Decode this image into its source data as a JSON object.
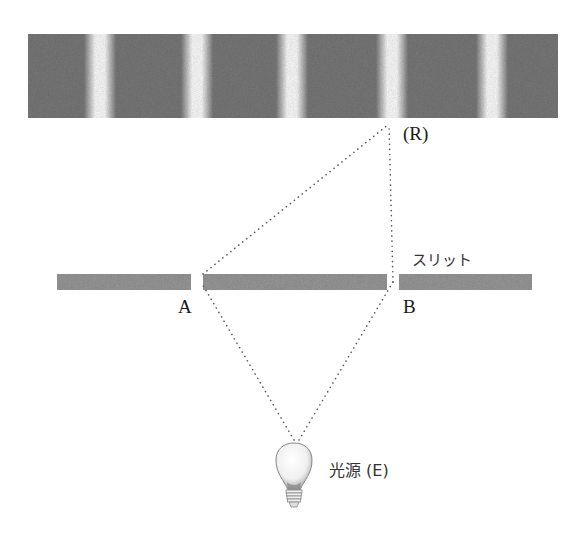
{
  "diagram": {
    "labels": {
      "screen_point": "(R)",
      "slit": "スリット",
      "slit_a": "A",
      "slit_b": "B",
      "light_source": "光源 (E)"
    },
    "fringe_screen": {
      "x": 28,
      "y": 34,
      "width": 530,
      "height": 84,
      "dark_color": "#7a7a7a",
      "bright_fringe_centers_x": [
        100,
        197,
        292,
        392,
        492
      ]
    },
    "slit_plate": {
      "y": 274,
      "height": 16,
      "color": "#9a9a9a",
      "segments": [
        {
          "x1": 57,
          "x2": 191
        },
        {
          "x1": 203,
          "x2": 387
        },
        {
          "x1": 399,
          "x2": 532
        }
      ]
    },
    "points": {
      "R": [
        389,
        124
      ],
      "A": [
        201,
        282
      ],
      "B": [
        393,
        282
      ],
      "E": [
        294,
        440
      ]
    },
    "line_color": "#555555"
  }
}
